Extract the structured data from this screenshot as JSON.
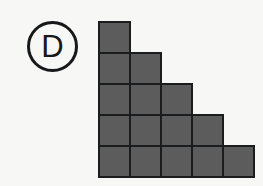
{
  "figure": {
    "label": "D",
    "label_shape": "circle",
    "background_color": "#f7f7f5",
    "cell_fill_color": "#5c5c5c",
    "cell_border_color": "#1b1c1e",
    "label_color": "#17181a"
  },
  "chart_data": {
    "type": "bar",
    "title": "",
    "subtitle": "",
    "xlabel": "",
    "ylabel": "",
    "orientation": "staircase-descending",
    "categories": [
      "Row 1",
      "Row 2",
      "Row 3",
      "Row 4",
      "Row 5"
    ],
    "values": [
      1,
      2,
      3,
      4,
      5
    ],
    "total_squares": 15,
    "rows": 5,
    "max_columns": 5,
    "grid": [
      [
        1,
        0,
        0,
        0,
        0
      ],
      [
        1,
        1,
        0,
        0,
        0
      ],
      [
        1,
        1,
        1,
        0,
        0
      ],
      [
        1,
        1,
        1,
        1,
        0
      ],
      [
        1,
        1,
        1,
        1,
        1
      ]
    ],
    "legend": [],
    "grid_on": false
  },
  "geometry": {
    "cell_size_px": 33,
    "grid_left_px": 98,
    "grid_top_px": 21,
    "badge_left_px": 27,
    "badge_top_px": 21,
    "badge_diameter_px": 51
  }
}
